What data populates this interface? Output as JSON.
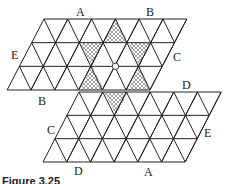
{
  "figure": {
    "caption": "Figure 3.25",
    "colors": {
      "line": "#222222",
      "hatch": "#555555",
      "background": "#ffffff"
    },
    "upper_grid": {
      "origin_top_left": [
        44,
        19
      ],
      "cols": 6,
      "rows": 3,
      "side": 23.8,
      "row_height": 23.67,
      "row_shift": -12.3
    },
    "lower_grid": {
      "origin_top_left": [
        79,
        92
      ],
      "cols": 6,
      "rows": 3,
      "side": 23.7,
      "row_height": 23.33,
      "row_shift": -12
    },
    "center_marker": {
      "x": 115.5,
      "y": 66.3,
      "r": 3.2
    },
    "shaded_triangles": [
      [
        [
          116,
          19
        ],
        [
          104,
          42.7
        ],
        [
          128,
          42.7
        ]
      ],
      [
        [
          80,
          42.7
        ],
        [
          104,
          42.7
        ],
        [
          92,
          66.3
        ]
      ],
      [
        [
          128,
          42.7
        ],
        [
          151,
          42.7
        ],
        [
          139.5,
          66.3
        ]
      ],
      [
        [
          92,
          66.3
        ],
        [
          80,
          90
        ],
        [
          104,
          90
        ]
      ],
      [
        [
          139.5,
          66.3
        ],
        [
          128,
          90
        ],
        [
          151,
          90
        ]
      ],
      [
        [
          104,
          92
        ],
        [
          128,
          92
        ],
        [
          116,
          115
        ]
      ]
    ],
    "labels": [
      {
        "text": "A",
        "x": 76,
        "y": 16,
        "name": "label-A-top"
      },
      {
        "text": "B",
        "x": 146,
        "y": 16,
        "name": "label-B-top"
      },
      {
        "text": "E",
        "x": 11,
        "y": 59,
        "name": "label-E-left"
      },
      {
        "text": "C",
        "x": 173,
        "y": 61,
        "name": "label-C-right"
      },
      {
        "text": "D",
        "x": 182,
        "y": 89,
        "name": "label-D-upper"
      },
      {
        "text": "B",
        "x": 38,
        "y": 105,
        "name": "label-B-lower"
      },
      {
        "text": "C",
        "x": 47,
        "y": 134,
        "name": "label-C-lower"
      },
      {
        "text": "E",
        "x": 204,
        "y": 137,
        "name": "label-E-lower"
      },
      {
        "text": "D",
        "x": 74,
        "y": 175,
        "name": "label-D-bottom"
      },
      {
        "text": "A",
        "x": 144,
        "y": 176,
        "name": "label-A-bottom"
      }
    ]
  }
}
